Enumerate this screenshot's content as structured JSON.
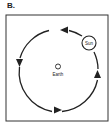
{
  "figure": {
    "panel_label": "B.",
    "sun_label": "Sun",
    "earth_label": "Earth",
    "orbit_direction": "counterclockwise",
    "colors": {
      "stroke": "#222222",
      "background": "#ffffff"
    }
  }
}
